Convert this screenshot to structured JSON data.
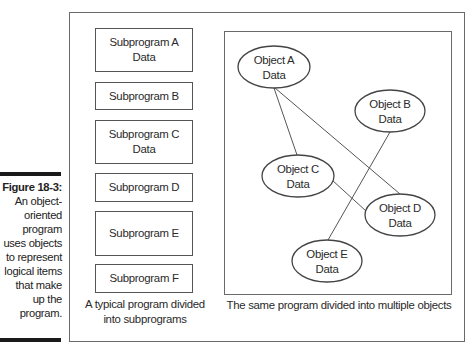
{
  "figure_caption": {
    "number": "Figure 18-3:",
    "lines": [
      "An object-",
      "oriented",
      "program",
      "uses objects",
      "to represent",
      "logical items",
      "that make",
      "up the",
      "program."
    ]
  },
  "left_panel": {
    "subprograms": [
      {
        "name": "Subprogram A",
        "data": "Data"
      },
      {
        "name": "Subprogram B",
        "data": ""
      },
      {
        "name": "Subprogram C",
        "data": "Data"
      },
      {
        "name": "Subprogram D",
        "data": ""
      },
      {
        "name": "Subprogram E",
        "data": ""
      },
      {
        "name": "Subprogram F",
        "data": ""
      }
    ],
    "caption_line1": "A typical program divided",
    "caption_line2": "into subprograms"
  },
  "right_panel": {
    "objects": [
      {
        "id": "A",
        "name": "Object A",
        "data": "Data"
      },
      {
        "id": "B",
        "name": "Object B",
        "data": "Data"
      },
      {
        "id": "C",
        "name": "Object C",
        "data": "Data"
      },
      {
        "id": "D",
        "name": "Object D",
        "data": "Data"
      },
      {
        "id": "E",
        "name": "Object E",
        "data": "Data"
      }
    ],
    "connections": [
      [
        "A",
        "C"
      ],
      [
        "A",
        "D"
      ],
      [
        "C",
        "D"
      ],
      [
        "B",
        "E"
      ]
    ],
    "caption": "The same program divided into multiple objects"
  },
  "colors": {
    "border": "#555555",
    "bar": "#1a1a1a",
    "text": "#2a2a2a"
  }
}
